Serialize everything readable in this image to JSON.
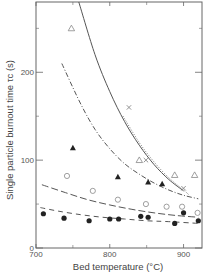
{
  "chart_data": {
    "type": "scatter",
    "title": "",
    "xlabel": "Bed temperature (°C)",
    "ylabel": "Single particle burnout time τc (s)",
    "xlim": [
      700,
      925
    ],
    "ylim": [
      0,
      280
    ],
    "xticks": [
      700,
      800,
      900
    ],
    "xminor_ticks": [
      750,
      850
    ],
    "yticks": [
      0,
      100,
      200
    ],
    "yminor_ticks": [
      50,
      150,
      250
    ],
    "grid": false,
    "legend": null,
    "series": [
      {
        "name": "filled circles",
        "marker": "filled-circle",
        "points": [
          [
            710,
            39
          ],
          [
            738,
            34
          ],
          [
            772,
            31
          ],
          [
            800,
            33
          ],
          [
            812,
            33
          ],
          [
            842,
            36
          ],
          [
            852,
            35
          ],
          [
            888,
            28
          ],
          [
            900,
            40
          ],
          [
            920,
            31
          ]
        ]
      },
      {
        "name": "open circles",
        "marker": "open-circle",
        "points": [
          [
            742,
            82
          ],
          [
            777,
            65
          ],
          [
            811,
            55
          ],
          [
            849,
            50
          ],
          [
            877,
            47
          ],
          [
            898,
            47
          ],
          [
            919,
            40
          ]
        ]
      },
      {
        "name": "filled triangles",
        "marker": "filled-triangle",
        "points": [
          [
            750,
            114
          ],
          [
            811,
            81
          ],
          [
            852,
            75
          ],
          [
            871,
            73
          ]
        ]
      },
      {
        "name": "open triangles",
        "marker": "open-triangle",
        "points": [
          [
            748,
            250
          ],
          [
            840,
            100
          ],
          [
            888,
            83
          ],
          [
            915,
            83
          ]
        ]
      },
      {
        "name": "crosses",
        "marker": "cross",
        "points": [
          [
            826,
            160
          ],
          [
            849,
            100
          ],
          [
            900,
            68
          ]
        ]
      }
    ],
    "curves": [
      {
        "name": "solid fit",
        "style": "solid",
        "points": [
          [
            758,
            280
          ],
          [
            780,
            220
          ],
          [
            800,
            178
          ],
          [
            820,
            144
          ],
          [
            840,
            117
          ],
          [
            860,
            95
          ],
          [
            880,
            78
          ],
          [
            900,
            65
          ]
        ]
      },
      {
        "name": "dotted fit",
        "style": "dotted",
        "points": [
          [
            818,
            150
          ],
          [
            840,
            120
          ],
          [
            860,
            98
          ],
          [
            880,
            80
          ],
          [
            900,
            66
          ],
          [
            908,
            60
          ]
        ]
      },
      {
        "name": "dash-dot fit",
        "style": "dash-dot",
        "points": [
          [
            735,
            210
          ],
          [
            760,
            165
          ],
          [
            780,
            135
          ],
          [
            800,
            113
          ],
          [
            820,
            96
          ],
          [
            840,
            84
          ],
          [
            860,
            74
          ],
          [
            880,
            66
          ],
          [
            900,
            60
          ],
          [
            920,
            56
          ]
        ]
      },
      {
        "name": "long-dash fit",
        "style": "long-dash",
        "points": [
          [
            708,
            72
          ],
          [
            740,
            63
          ],
          [
            770,
            55
          ],
          [
            800,
            49
          ],
          [
            830,
            44
          ],
          [
            860,
            40
          ],
          [
            890,
            37
          ],
          [
            920,
            35
          ]
        ]
      },
      {
        "name": "short-dash fit",
        "style": "short-dash",
        "points": [
          [
            706,
            46
          ],
          [
            730,
            42
          ],
          [
            760,
            38
          ],
          [
            790,
            35
          ],
          [
            820,
            33
          ],
          [
            850,
            31
          ],
          [
            880,
            30
          ],
          [
            920,
            28
          ]
        ]
      }
    ]
  },
  "colors": {
    "axis": "#666666",
    "line": "#555555",
    "marker": "#222222",
    "open_marker": "#888888",
    "text": "#555555"
  }
}
